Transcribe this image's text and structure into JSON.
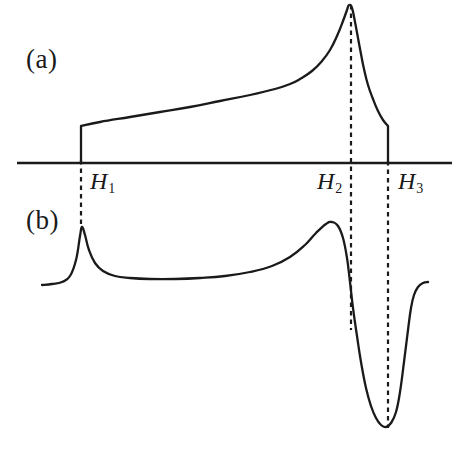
{
  "figure": {
    "background_color": "#ffffff",
    "line_color": "#1a1a1a",
    "width": 461,
    "height": 450
  },
  "panels": {
    "a": {
      "label": "(a)"
    },
    "b": {
      "label": "(b)"
    }
  },
  "field_markers": [
    {
      "name": "H1",
      "symbol": "H",
      "subscript": "1"
    },
    {
      "name": "H2",
      "symbol": "H",
      "subscript": "2"
    },
    {
      "name": "H3",
      "symbol": "H",
      "subscript": "3"
    }
  ],
  "chart_data": {
    "type": "line",
    "title": "",
    "xlabel": "",
    "ylabel": "",
    "subtitle": "",
    "grid": false,
    "legend": "none",
    "axis": {
      "horizontal_baseline": true,
      "x_start_px": 17,
      "x_end_px": 452,
      "baseline_y_px": 163
    },
    "annotations": [
      {
        "text": "(a)",
        "x_px": 26,
        "y_px": 44,
        "role": "panel-label"
      },
      {
        "text": "(b)",
        "x_px": 26,
        "y_px": 205,
        "role": "panel-label"
      },
      {
        "text": "H_1",
        "x_px": 90,
        "y_px": 168,
        "role": "tick-label"
      },
      {
        "text": "H_2",
        "x_px": 317,
        "y_px": 168,
        "role": "tick-label"
      },
      {
        "text": "H_3",
        "x_px": 398,
        "y_px": 168,
        "role": "tick-label"
      }
    ],
    "vertical_markers": [
      {
        "name": "H1",
        "x_px": 81,
        "y_top_px": 160,
        "y_bottom_px": 224,
        "style": "dashed"
      },
      {
        "name": "H2",
        "x_px": 351,
        "y_top_px": 5,
        "y_bottom_px": 330,
        "style": "dashed"
      },
      {
        "name": "H3",
        "x_px": 388,
        "y_top_px": 161,
        "y_bottom_px": 428,
        "style": "dashed"
      }
    ],
    "series": [
      {
        "name": "panel-a-magnetization",
        "panel": "a",
        "description": "Magnetization: zero below H1, jumps up at H1, rises slowly, diverges at H2, falls, drops to zero at H3",
        "points": [
          [
            81,
            163
          ],
          [
            81,
            126
          ],
          [
            100,
            122
          ],
          [
            130,
            117
          ],
          [
            160,
            112
          ],
          [
            190,
            107
          ],
          [
            220,
            101
          ],
          [
            250,
            95
          ],
          [
            275,
            89
          ],
          [
            290,
            84
          ],
          [
            300,
            79
          ],
          [
            312,
            71
          ],
          [
            322,
            61
          ],
          [
            330,
            50
          ],
          [
            337,
            36
          ],
          [
            343,
            21
          ],
          [
            347,
            10
          ],
          [
            349,
            5
          ],
          [
            352,
            8
          ],
          [
            355,
            22
          ],
          [
            358,
            38
          ],
          [
            361,
            54
          ],
          [
            364,
            69
          ],
          [
            368,
            85
          ],
          [
            373,
            99
          ],
          [
            378,
            111
          ],
          [
            383,
            120
          ],
          [
            388,
            126
          ],
          [
            388,
            163
          ]
        ]
      },
      {
        "name": "panel-b-derivative",
        "panel": "b",
        "description": "Derivative: sharp peak at H1, broad rise to a peak just before H2, steep fall to deep minimum at H3, then recovery",
        "points": [
          [
            42,
            285
          ],
          [
            52,
            284
          ],
          [
            62,
            282
          ],
          [
            70,
            276
          ],
          [
            76,
            260
          ],
          [
            80,
            236
          ],
          [
            82,
            227
          ],
          [
            85,
            235
          ],
          [
            89,
            250
          ],
          [
            95,
            263
          ],
          [
            103,
            271
          ],
          [
            115,
            276
          ],
          [
            130,
            278
          ],
          [
            150,
            279
          ],
          [
            175,
            279
          ],
          [
            200,
            278
          ],
          [
            225,
            276
          ],
          [
            250,
            272
          ],
          [
            272,
            266
          ],
          [
            290,
            257
          ],
          [
            305,
            245
          ],
          [
            316,
            233
          ],
          [
            326,
            224
          ],
          [
            332,
            222
          ],
          [
            338,
            226
          ],
          [
            343,
            238
          ],
          [
            347,
            258
          ],
          [
            350,
            282
          ],
          [
            353,
            308
          ],
          [
            357,
            336
          ],
          [
            361,
            362
          ],
          [
            366,
            388
          ],
          [
            371,
            406
          ],
          [
            376,
            418
          ],
          [
            381,
            425
          ],
          [
            386,
            427
          ],
          [
            391,
            423
          ],
          [
            396,
            412
          ],
          [
            400,
            392
          ],
          [
            404,
            362
          ],
          [
            408,
            330
          ],
          [
            411,
            308
          ],
          [
            414,
            295
          ],
          [
            418,
            287
          ],
          [
            423,
            283
          ],
          [
            428,
            282
          ]
        ]
      }
    ]
  }
}
